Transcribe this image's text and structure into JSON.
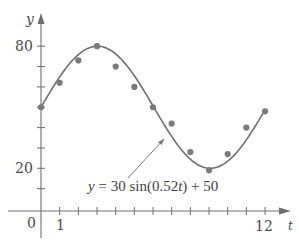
{
  "chart_data": {
    "type": "scatter",
    "title": "",
    "xlabel": "t",
    "ylabel": "y",
    "xlim": [
      0,
      12.6
    ],
    "ylim": [
      0,
      95
    ],
    "x_ticks": [
      0,
      1,
      2,
      3,
      4,
      5,
      6,
      7,
      8,
      9,
      10,
      11,
      12
    ],
    "x_tick_labels_shown": {
      "origin": "0",
      "first": "1",
      "last": "12"
    },
    "y_ticks": [
      10,
      20,
      30,
      40,
      50,
      60,
      70,
      80
    ],
    "y_tick_labels_shown": [
      "20",
      "80"
    ],
    "grid": false,
    "series": [
      {
        "name": "data points",
        "type": "scatter",
        "x": [
          0,
          1,
          2,
          3,
          4,
          5,
          6,
          7,
          8,
          9,
          10,
          11,
          12
        ],
        "y": [
          50,
          62,
          73,
          80,
          70,
          60,
          50,
          42,
          28,
          19,
          27,
          40,
          48
        ]
      },
      {
        "name": "model",
        "type": "line",
        "function": "y = 30 sin(0.52t) + 50",
        "amplitude": 30,
        "frequency": 0.52,
        "offset": 50
      }
    ],
    "annotations": [
      {
        "text": "y = 30 sin(0.52t) + 50",
        "points_to": "curve near t=6.5"
      }
    ]
  },
  "labels": {
    "y_axis": "y",
    "x_axis": "t",
    "origin": "0",
    "x_first": "1",
    "x_last": "12",
    "y_20": "20",
    "y_80": "80",
    "equation_y": "y",
    "equation_eq": " = 30 sin(0.52",
    "equation_t": "t",
    "equation_tail": ") + 50"
  },
  "colors": {
    "axis": "#6e6e6e",
    "curve": "#6f6f6f",
    "points": "#7a7a7a",
    "text": "#4a4a4a"
  }
}
